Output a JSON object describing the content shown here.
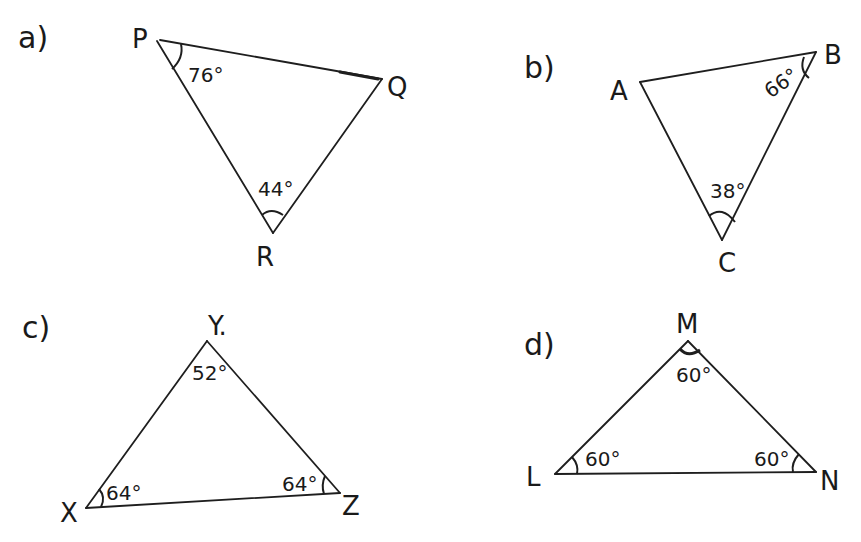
{
  "problems": [
    {
      "label": "a)",
      "vertices": {
        "P": "P",
        "Q": "Q",
        "R": "R"
      },
      "angles": {
        "P": "76°",
        "R": "44°"
      }
    },
    {
      "label": "b)",
      "vertices": {
        "A": "A",
        "B": "B",
        "C": "C"
      },
      "angles": {
        "B": "66°",
        "C": "38°"
      }
    },
    {
      "label": "c)",
      "vertices": {
        "X": "X",
        "Y": "Y.",
        "Z": "Z"
      },
      "angles": {
        "Y": "52°",
        "X": "64°",
        "Z": "64°"
      }
    },
    {
      "label": "d)",
      "vertices": {
        "M": "M",
        "L": "L",
        "N": "N"
      },
      "angles": {
        "M": "60°",
        "L": "60°",
        "N": "60°"
      }
    }
  ]
}
